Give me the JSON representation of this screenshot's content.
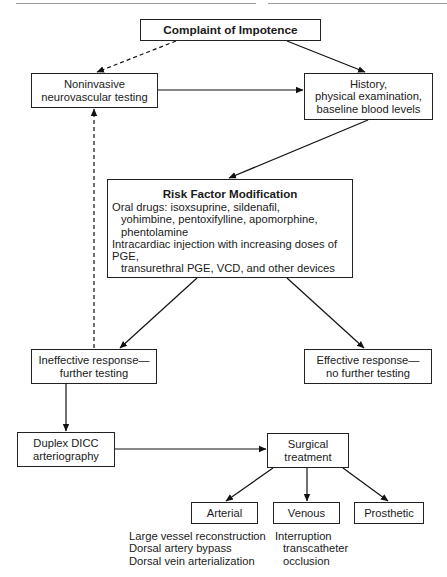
{
  "diagram": {
    "type": "flowchart",
    "nodes": {
      "complaint": "Complaint of Impotence",
      "noninvasive": [
        "Noninvasive",
        "neurovascular testing"
      ],
      "history": [
        "History,",
        "physical examination,",
        "baseline blood levels"
      ],
      "risk": {
        "title": "Risk Factor Modification",
        "lines": [
          "Oral drugs: isoxsuprine, sildenafil,",
          "yohimbine, pentoxifylline, apomorphine,",
          "phentolamine",
          "Intracardiac injection with increasing doses of PGE,",
          "transurethral PGE, VCD, and other devices"
        ]
      },
      "ineffective": [
        "Ineffective response—",
        "further testing"
      ],
      "effective": [
        "Effective response—",
        "no further testing"
      ],
      "duplex": [
        "Duplex DICC",
        "arteriography"
      ],
      "surgical": [
        "Surgical",
        "treatment"
      ],
      "arterial": "Arterial",
      "venous": "Venous",
      "prosthetic": "Prosthetic"
    },
    "notes": {
      "arterial": [
        "Large vessel reconstruction",
        "Dorsal artery bypass",
        "Dorsal vein arterialization"
      ],
      "venous": [
        "Interruption",
        "transcatheter",
        "occlusion"
      ]
    },
    "edges": [
      {
        "from": "Complaint of Impotence",
        "to": "Noninvasive neurovascular testing",
        "style": "dashed"
      },
      {
        "from": "Complaint of Impotence",
        "to": "History, physical examination, baseline blood levels",
        "style": "solid"
      },
      {
        "from": "Noninvasive neurovascular testing",
        "to": "History, physical examination, baseline blood levels",
        "style": "solid"
      },
      {
        "from": "History, physical examination, baseline blood levels",
        "to": "Risk Factor Modification",
        "style": "solid"
      },
      {
        "from": "Risk Factor Modification",
        "to": "Ineffective response—further testing",
        "style": "solid"
      },
      {
        "from": "Risk Factor Modification",
        "to": "Effective response—no further testing",
        "style": "solid"
      },
      {
        "from": "Ineffective response—further testing",
        "to": "Noninvasive neurovascular testing",
        "style": "dashed"
      },
      {
        "from": "Ineffective response—further testing",
        "to": "Duplex DICC arteriography",
        "style": "solid"
      },
      {
        "from": "Duplex DICC arteriography",
        "to": "Surgical treatment",
        "style": "solid"
      },
      {
        "from": "Surgical treatment",
        "to": "Arterial",
        "style": "solid"
      },
      {
        "from": "Surgical treatment",
        "to": "Venous",
        "style": "solid"
      },
      {
        "from": "Surgical treatment",
        "to": "Prosthetic",
        "style": "solid"
      }
    ]
  }
}
